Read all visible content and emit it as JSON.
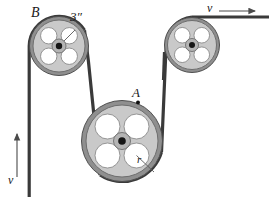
{
  "figure": {
    "type": "mechanics-diagram",
    "canvas": {
      "width": 269,
      "height": 197
    },
    "background": "#ffffff"
  },
  "colors": {
    "belt": "#3a3a3a",
    "rim": "#555555",
    "disk_fill": "#c9c9c9",
    "disk_edge": "#6e6e6e",
    "hole_fill": "#ffffff",
    "hole_edge": "#8a8a8a",
    "hub": "#161616",
    "label": "#1a1a1a",
    "arrow": "#4a4a4a"
  },
  "labels": {
    "pulley_b": "B",
    "diameter_b": "3″",
    "point_a": "A",
    "radius_r": "r",
    "velocity_top": "v",
    "velocity_left": "v"
  },
  "pulleys": [
    {
      "id": "pulley-b",
      "name": "pulley-b",
      "label": "B",
      "cx": 59,
      "cy": 46,
      "rim_radius": 30,
      "disk_radius": 26,
      "hub_outer": 7,
      "hub_inner": 3.2,
      "hole_radius": 8.2,
      "hole_orbit": 14.5,
      "hole_angles": [
        45,
        135,
        225,
        315
      ],
      "dimension_label": "3″"
    },
    {
      "id": "pulley-right",
      "name": "pulley-right",
      "label": "",
      "cx": 192,
      "cy": 45,
      "rim_radius": 28,
      "disk_radius": 24.5,
      "hub_outer": 6.5,
      "hub_inner": 3,
      "hole_radius": 7.8,
      "hole_orbit": 13.8,
      "hole_angles": [
        45,
        135,
        225,
        315
      ],
      "dimension_label": ""
    },
    {
      "id": "pulley-a",
      "name": "pulley-a",
      "label": "A",
      "cx": 122,
      "cy": 141,
      "rim_radius": 41,
      "disk_radius": 36,
      "hub_outer": 8.5,
      "hub_inner": 3.8,
      "hole_radius": 12.5,
      "hole_orbit": 20.5,
      "hole_angles": [
        45,
        135,
        225,
        315
      ],
      "dimension_label": "r"
    }
  ],
  "markers": {
    "point_a": {
      "x": 138,
      "y": 102.5,
      "radius": 2.0,
      "label": "A"
    },
    "radius_line_a": {
      "x1": 136.5,
      "y1": 147.5,
      "x2": 157,
      "y2": 168,
      "label": "r"
    },
    "radius_line_b": {
      "x1": 65.5,
      "y1": 39.5,
      "x2": 79,
      "y2": 27,
      "label": "3″"
    }
  },
  "arrows": [
    {
      "id": "velocity-top",
      "name": "velocity-arrow-top",
      "label": "v",
      "direction": "right",
      "x1": 219,
      "y1": 11,
      "x2": 258,
      "y2": 11
    },
    {
      "id": "velocity-left",
      "name": "velocity-arrow-left",
      "label": "v",
      "direction": "up",
      "x1": 17,
      "y1": 177,
      "x2": 17,
      "y2": 131
    }
  ],
  "belt": {
    "name": "drive-belt",
    "stroke_width": 3.2,
    "segments": [
      {
        "name": "belt-left-vertical",
        "from": [
          29,
          46
        ],
        "to": [
          29,
          197
        ]
      },
      {
        "name": "belt-b-to-a",
        "from": [
          86,
          58
        ],
        "to": [
          104,
          178
        ]
      },
      {
        "name": "belt-a-to-right",
        "from": [
          160,
          150
        ],
        "to": [
          166,
          40
        ]
      },
      {
        "name": "belt-top-horizontal",
        "from": [
          192,
          17
        ],
        "to": [
          269,
          17
        ]
      }
    ]
  }
}
